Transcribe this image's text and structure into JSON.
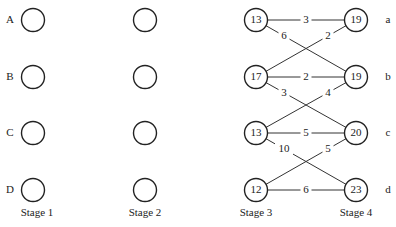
{
  "diagram": {
    "type": "multistage-network",
    "stages": [
      {
        "label": "Stage 1",
        "x": 33,
        "row_labels": [
          "A",
          "B",
          "C",
          "D"
        ],
        "node_values": [
          "",
          "",
          "",
          ""
        ]
      },
      {
        "label": "Stage 2",
        "x": 145,
        "row_labels": [],
        "node_values": [
          "",
          "",
          "",
          ""
        ]
      },
      {
        "label": "Stage 3",
        "x": 256,
        "row_labels": [],
        "node_values": [
          "13",
          "17",
          "13",
          "12"
        ]
      },
      {
        "label": "Stage 4",
        "x": 356,
        "row_labels": [
          "a",
          "b",
          "c",
          "d"
        ],
        "node_values": [
          "19",
          "19",
          "20",
          "23"
        ]
      }
    ],
    "rows_y": [
      20,
      77,
      133,
      190
    ],
    "edges": [
      {
        "from": [
          2,
          0
        ],
        "to": [
          3,
          0
        ],
        "weight": "3"
      },
      {
        "from": [
          2,
          0
        ],
        "to": [
          3,
          1
        ],
        "weight": "6"
      },
      {
        "from": [
          2,
          1
        ],
        "to": [
          3,
          0
        ],
        "weight": "2"
      },
      {
        "from": [
          2,
          1
        ],
        "to": [
          3,
          1
        ],
        "weight": "2"
      },
      {
        "from": [
          2,
          1
        ],
        "to": [
          3,
          2
        ],
        "weight": "3"
      },
      {
        "from": [
          2,
          2
        ],
        "to": [
          3,
          1
        ],
        "weight": "4"
      },
      {
        "from": [
          2,
          2
        ],
        "to": [
          3,
          2
        ],
        "weight": "5"
      },
      {
        "from": [
          2,
          2
        ],
        "to": [
          3,
          3
        ],
        "weight": "10"
      },
      {
        "from": [
          2,
          3
        ],
        "to": [
          3,
          2
        ],
        "weight": "5"
      },
      {
        "from": [
          2,
          3
        ],
        "to": [
          3,
          3
        ],
        "weight": "6"
      }
    ]
  }
}
